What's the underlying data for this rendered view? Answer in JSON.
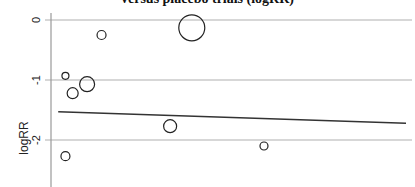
{
  "chart_data": {
    "type": "scatter",
    "title": "versus placebo trials (logRR)",
    "xlabel": "",
    "ylabel": "logRR",
    "yticks": [
      0,
      -1,
      -2
    ],
    "ytick_labels": [
      "0",
      "-1",
      "-2"
    ],
    "ylim": [
      -2.45,
      0.1
    ],
    "grid": true,
    "legend": null,
    "points": [
      {
        "x": 0.04,
        "y": -2.27,
        "size": 4.5
      },
      {
        "x": 0.04,
        "y": -0.93,
        "size": 3.5
      },
      {
        "x": 0.06,
        "y": -1.22,
        "size": 5.5
      },
      {
        "x": 0.1,
        "y": -1.07,
        "size": 7.5
      },
      {
        "x": 0.14,
        "y": -0.25,
        "size": 4.5
      },
      {
        "x": 0.33,
        "y": -1.77,
        "size": 6.5
      },
      {
        "x": 0.39,
        "y": -0.13,
        "size": 13
      },
      {
        "x": 0.59,
        "y": -2.1,
        "size": 4
      }
    ],
    "fit_line": {
      "x": [
        0.02,
        1.0
      ],
      "y": [
        -1.53,
        -1.72
      ]
    }
  },
  "colors": {
    "grid": "#b0b0b0",
    "axis": "#999999",
    "marker": "#222222",
    "fit_line": "#333333"
  }
}
